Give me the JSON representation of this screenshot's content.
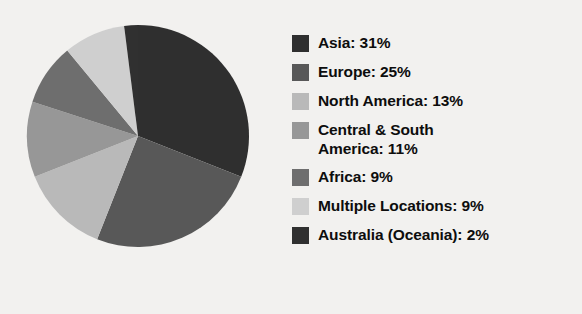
{
  "background_color": "#f2f1ef",
  "chart_data": {
    "type": "pie",
    "title": "",
    "start_angle_deg": 0,
    "direction": "clockwise",
    "legend_position": "right",
    "grid": false,
    "categories": [
      "Asia",
      "Europe",
      "North America",
      "Central & South America",
      "Africa",
      "Multiple Locations",
      "Australia (Oceania)"
    ],
    "values": [
      31,
      25,
      13,
      11,
      9,
      9,
      2
    ],
    "value_unit": "%",
    "colors": [
      "#2f2f2f",
      "#585858",
      "#b9b9b9",
      "#979797",
      "#6e6e6e",
      "#cfcfcf",
      "#303030"
    ],
    "slices": [
      {
        "label": "Asia",
        "value": 31,
        "color": "#2f2f2f",
        "legend_text": "Asia: 31%"
      },
      {
        "label": "Europe",
        "value": 25,
        "color": "#585858",
        "legend_text": "Europe: 25%"
      },
      {
        "label": "North America",
        "value": 13,
        "color": "#b9b9b9",
        "legend_text": "North America: 13%"
      },
      {
        "label": "Central & South America",
        "value": 11,
        "color": "#979797",
        "legend_text": "Central & South\nAmerica: 11%"
      },
      {
        "label": "Africa",
        "value": 9,
        "color": "#6e6e6e",
        "legend_text": "Africa: 9%"
      },
      {
        "label": "Multiple Locations",
        "value": 9,
        "color": "#cfcfcf",
        "legend_text": "Multiple Locations: 9%"
      },
      {
        "label": "Australia (Oceania)",
        "value": 2,
        "color": "#303030",
        "legend_text": "Australia (Oceania): 2%"
      }
    ]
  },
  "legend": {
    "items": [
      {
        "text": "Asia: 31%",
        "color": "#2f2f2f"
      },
      {
        "text": "Europe: 25%",
        "color": "#585858"
      },
      {
        "text": "North America: 13%",
        "color": "#b9b9b9"
      },
      {
        "text": "Central & South\nAmerica: 11%",
        "color": "#979797"
      },
      {
        "text": "Africa: 9%",
        "color": "#6e6e6e"
      },
      {
        "text": "Multiple Locations: 9%",
        "color": "#cfcfcf"
      },
      {
        "text": "Australia (Oceania): 2%",
        "color": "#303030"
      }
    ]
  }
}
